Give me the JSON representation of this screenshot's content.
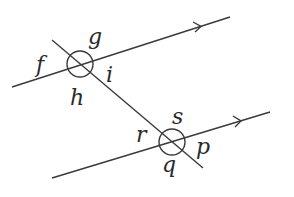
{
  "diagram": {
    "colors": {
      "stroke": "#3a3a3a",
      "text": "#2a2a2a",
      "background": "#ffffff"
    },
    "lines": {
      "upper_parallel": {
        "x1": 12,
        "y1": 87,
        "x2": 230,
        "y2": 17,
        "arrow_at": [
          200,
          26.6
        ]
      },
      "lower_parallel": {
        "x1": 52,
        "y1": 178,
        "x2": 270,
        "y2": 112,
        "arrow_at": [
          240,
          121
        ]
      },
      "transversal": {
        "x1": 52,
        "y1": 40,
        "x2": 203,
        "y2": 168
      }
    },
    "intersections": [
      {
        "name": "upper",
        "cx": 80,
        "cy": 64,
        "r": 13
      },
      {
        "name": "lower",
        "cx": 172,
        "cy": 142,
        "r": 13
      }
    ],
    "labels": {
      "f": {
        "text": "f",
        "x": 36,
        "y": 72
      },
      "g": {
        "text": "g",
        "x": 88,
        "y": 44
      },
      "h": {
        "text": "h",
        "x": 70,
        "y": 105
      },
      "i": {
        "text": "i",
        "x": 106,
        "y": 82
      },
      "s": {
        "text": "s",
        "x": 172,
        "y": 124
      },
      "r": {
        "text": "r",
        "x": 136,
        "y": 142
      },
      "p": {
        "text": "p",
        "x": 196,
        "y": 154
      },
      "q": {
        "text": "q",
        "x": 162,
        "y": 172
      }
    }
  }
}
